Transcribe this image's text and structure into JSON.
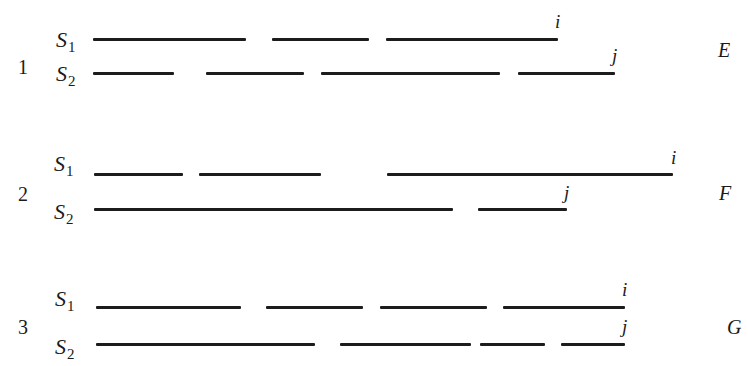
{
  "diagram": {
    "line_color": "#1c1c1c",
    "rows": [
      {
        "number": "1",
        "case_label": "E",
        "number_pos": [
          18,
          57
        ],
        "case_pos": [
          718,
          40
        ],
        "sequences": [
          {
            "name": "S",
            "sub": "1",
            "label_pos": [
              56,
              29
            ],
            "y": 39,
            "segments": [
              [
                93,
                246
              ],
              [
                272,
                369
              ],
              [
                386,
                558
              ]
            ],
            "end_label": "i",
            "end_pos": [
              555,
              12
            ]
          },
          {
            "name": "S",
            "sub": "2",
            "label_pos": [
              56,
              63
            ],
            "y": 73,
            "segments": [
              [
                93,
                174
              ],
              [
                206,
                304
              ],
              [
                321,
                500
              ],
              [
                518,
                615
              ]
            ],
            "end_label": "j",
            "end_pos": [
              612,
              46
            ]
          }
        ]
      },
      {
        "number": "2",
        "case_label": "F",
        "number_pos": [
          18,
          184
        ],
        "case_pos": [
          719,
          183
        ],
        "sequences": [
          {
            "name": "S",
            "sub": "1",
            "label_pos": [
              54,
              153
            ],
            "y": 174,
            "segments": [
              [
                94,
                183
              ],
              [
                199,
                321
              ],
              [
                387,
                673
              ]
            ],
            "end_label": "i",
            "end_pos": [
              671,
              148
            ]
          },
          {
            "name": "S",
            "sub": "2",
            "label_pos": [
              54,
              201
            ],
            "y": 209,
            "segments": [
              [
                94,
                453
              ],
              [
                478,
                567
              ]
            ],
            "end_label": "j",
            "end_pos": [
              564,
              183
            ]
          }
        ]
      },
      {
        "number": "3",
        "case_label": "G",
        "number_pos": [
          18,
          317
        ],
        "case_pos": [
          727,
          317
        ],
        "sequences": [
          {
            "name": "S",
            "sub": "1",
            "label_pos": [
              55,
              288
            ],
            "y": 307,
            "segments": [
              [
                96,
                241
              ],
              [
                266,
                363
              ],
              [
                380,
                487
              ],
              [
                503,
                625
              ]
            ],
            "end_label": "i",
            "end_pos": [
              622,
              280
            ]
          },
          {
            "name": "S",
            "sub": "2",
            "label_pos": [
              55,
              336
            ],
            "y": 344,
            "segments": [
              [
                96,
                315
              ],
              [
                340,
                471
              ],
              [
                480,
                545
              ],
              [
                561,
                625
              ]
            ],
            "end_label": "j",
            "end_pos": [
              622,
              317
            ]
          }
        ]
      }
    ]
  }
}
